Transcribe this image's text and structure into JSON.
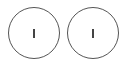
{
  "buttons": [
    {
      "label": "I",
      "icon": "power-on-icon"
    },
    {
      "label": "I",
      "icon": "power-on-icon"
    }
  ]
}
